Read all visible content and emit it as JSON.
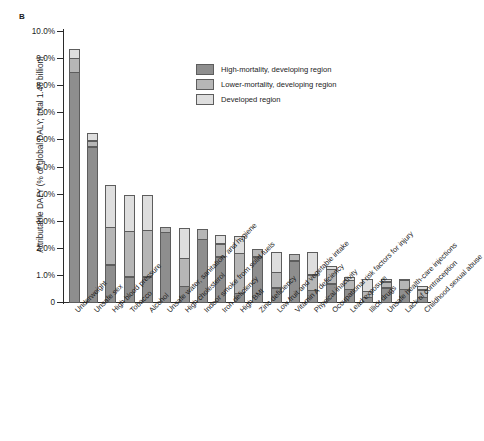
{
  "panel": {
    "label": "B"
  },
  "axes": {
    "ylabel": "Attributable DALY (% of global DALY; total 1.46 billion)",
    "xlabel": "",
    "yticks": [
      "10.0%",
      "9.0%",
      "8.0%",
      "7.0%",
      "6.0%",
      "5.0%",
      "4.0%",
      "3.0%",
      "2.0%",
      "1.0%",
      "0"
    ],
    "ymin": 0,
    "ymax": 10
  },
  "legend": {
    "position": "top-right-inside",
    "entries": [
      {
        "key": "high",
        "label": "High-mortality, developing region",
        "color": "#8e8e8e"
      },
      {
        "key": "lower",
        "label": "Lower-mortality, developing region",
        "color": "#b6b6b6"
      },
      {
        "key": "dev",
        "label": "Developed region",
        "color": "#dedede"
      }
    ]
  },
  "chart_data": {
    "type": "bar",
    "stacked": true,
    "title": "",
    "xlabel": "",
    "ylabel": "Attributable DALY (% of global DALY; total 1.46 billion)",
    "ylim": [
      0,
      10
    ],
    "ytick_step": 1.0,
    "grid": false,
    "units": "percent of global DALY",
    "total_daly_billion": 1.46,
    "categories": [
      "Underweight",
      "Unsafe sex",
      "High blood pressure",
      "Tobacco",
      "Alcohol",
      "Unsafe water, sanitation, and hygiene",
      "High cholesterol",
      "Indoor smoke from solid fuels",
      "Iron deficiency",
      "High BMI",
      "Zinc deficiency",
      "Low fruit and vegetable intake",
      "Vitamin A deficiency",
      "Physical inactivity",
      "Occupational risk factors for injury",
      "Lead exposure",
      "Illicit drugs",
      "Unsafe health-care injections",
      "Lack of contraception",
      "Childhood sexual abuse"
    ],
    "series": [
      {
        "name": "High-mortality, developing region",
        "color": "#8e8e8e",
        "values": [
          8.5,
          5.75,
          1.4,
          0.95,
          0.95,
          2.6,
          0.6,
          2.35,
          1.7,
          0.35,
          1.7,
          0.55,
          1.55,
          0.45,
          0.7,
          0.5,
          0.2,
          0.55,
          0.5,
          0.2
        ]
      },
      {
        "name": "Lower-mortality, developing region",
        "color": "#b6b6b6",
        "values": [
          0.55,
          0.25,
          1.4,
          1.7,
          1.75,
          0.2,
          1.05,
          0.4,
          0.5,
          1.5,
          0.3,
          0.6,
          0.25,
          0.6,
          0.55,
          0.35,
          0.25,
          0.25,
          0.35,
          0.3
        ]
      },
      {
        "name": "Developed region",
        "color": "#dedede",
        "values": [
          0.35,
          0.3,
          1.6,
          1.35,
          1.3,
          0.0,
          1.15,
          0.0,
          0.35,
          0.65,
          0.0,
          0.75,
          0.0,
          0.85,
          0.15,
          0.15,
          0.45,
          0.1,
          0.05,
          0.15
        ]
      }
    ],
    "totals": [
      9.4,
      6.3,
      4.4,
      4.0,
      4.0,
      2.8,
      2.8,
      2.75,
      2.55,
      2.5,
      2.0,
      1.9,
      1.8,
      1.9,
      1.4,
      1.0,
      0.9,
      0.9,
      0.9,
      0.65
    ]
  }
}
